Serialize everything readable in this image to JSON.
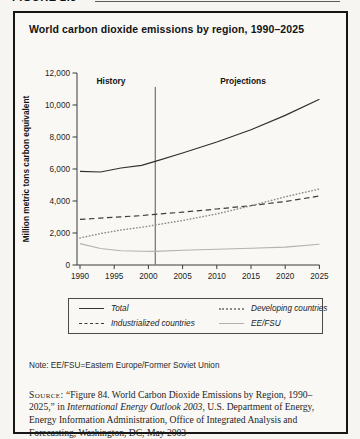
{
  "figure_label": "FIGURE 2.3",
  "title": "World carbon dioxide emissions by region, 1990–2025",
  "chart_data": {
    "type": "line",
    "title": "World carbon dioxide emissions by region, 1990–2025",
    "xlabel": "",
    "ylabel": "Million metric tons carbon equivalent",
    "ylim": [
      0,
      12000
    ],
    "ytick_step": 2000,
    "xticks": [
      1990,
      1995,
      2000,
      2005,
      2010,
      2015,
      2020,
      2025
    ],
    "grid": false,
    "legend_position": "bottom-box",
    "annotations": {
      "history_label": "History",
      "projections_label": "Projections",
      "divider_year": 2001
    },
    "x": [
      1990,
      1993,
      1996,
      1999,
      2001,
      2005,
      2010,
      2015,
      2020,
      2025
    ],
    "series": [
      {
        "name": "Total",
        "style": "solid-dark",
        "values": [
          5850,
          5810,
          6060,
          6230,
          6480,
          7000,
          7685,
          8455,
          9350,
          10360
        ]
      },
      {
        "name": "Industrialized countries",
        "style": "dashed",
        "values": [
          2850,
          2930,
          3010,
          3090,
          3170,
          3300,
          3500,
          3710,
          3970,
          4310
        ]
      },
      {
        "name": "Developing countries",
        "style": "dotted",
        "values": [
          1690,
          1960,
          2190,
          2360,
          2500,
          2780,
          3195,
          3700,
          4265,
          4750
        ]
      },
      {
        "name": "EE/FSU",
        "style": "solid-light",
        "values": [
          1340,
          1030,
          890,
          855,
          850,
          920,
          990,
          1050,
          1120,
          1300
        ]
      }
    ]
  },
  "legend": {
    "items": [
      {
        "label": "Total",
        "style": "solid-dark"
      },
      {
        "label": "Developing countries",
        "style": "dotted"
      },
      {
        "label": "Industrialized countries",
        "style": "dashed"
      },
      {
        "label": "EE/FSU",
        "style": "solid-light"
      }
    ]
  },
  "note": "Note: EE/FSU=Eastern Europe/Former Soviet Union",
  "source": {
    "label": "Source:",
    "text_before": "“Figure 84. World Carbon Dioxide Emissions by Region, 1990–2025,” in ",
    "italic_title": "International Energy Outlook 2003",
    "text_after": ", U.S. Department of Energy, Energy Information Administration, Office of Integrated Analysis and Forecasting, Washington, DC, May 2003"
  },
  "colors": {
    "paper": "#f9f8f5",
    "border": "#161616",
    "axis": "#3a3a3a",
    "total_line": "#2f2f2f",
    "industrialized_line": "#3c3c3c",
    "developing_line": "#8c8c8c",
    "eefsu_line": "#b2b2b2",
    "divider": "#555555"
  }
}
